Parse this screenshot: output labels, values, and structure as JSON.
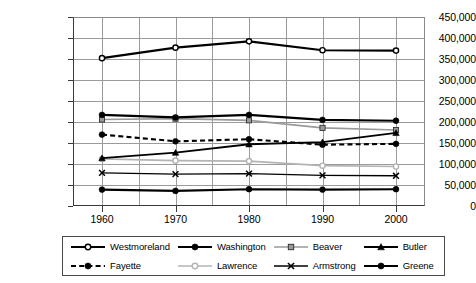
{
  "chart_data": {
    "type": "line",
    "title": "",
    "xlabel": "",
    "ylabel": "",
    "categories": [
      "1960",
      "1970",
      "1980",
      "1990",
      "2000"
    ],
    "x": [
      1960,
      1970,
      1980,
      1990,
      2000
    ],
    "ylim": [
      0,
      450000
    ],
    "ytick_step": 50000,
    "ytick_labels": [
      "450,000",
      "400,000",
      "350,000",
      "300,000",
      "250,000",
      "200,000",
      "150,000",
      "100,000",
      "50,000",
      "0"
    ],
    "ytick_values": [
      450000,
      400000,
      350000,
      300000,
      250000,
      200000,
      150000,
      100000,
      50000,
      0
    ],
    "grid": true,
    "legend_position": "bottom",
    "series": [
      {
        "name": "Westmoreland",
        "values": [
          352000,
          377000,
          392000,
          371000,
          370000
        ],
        "color": "#000000",
        "marker": "circle-open",
        "dash": "solid",
        "width": 2.1
      },
      {
        "name": "Washington",
        "values": [
          217000,
          211000,
          217000,
          205000,
          203000
        ],
        "color": "#000000",
        "marker": "circle-filled",
        "dash": "solid",
        "width": 2.1
      },
      {
        "name": "Beaver",
        "values": [
          206000,
          208000,
          204000,
          186000,
          181000
        ],
        "color": "#9a9a9a",
        "marker": "square-filled",
        "dash": "solid",
        "width": 1.7
      },
      {
        "name": "Butler",
        "values": [
          114000,
          127000,
          147000,
          152000,
          174000
        ],
        "color": "#000000",
        "marker": "triangle-filled",
        "dash": "solid",
        "width": 1.9
      },
      {
        "name": "Fayette",
        "values": [
          170000,
          154000,
          159000,
          146000,
          148000
        ],
        "color": "#000000",
        "marker": "circle-filled",
        "dash": "dashed",
        "width": 2.1
      },
      {
        "name": "Lawrence",
        "values": [
          112000,
          108000,
          107000,
          96000,
          94000
        ],
        "color": "#b4b4b4",
        "marker": "circle-open",
        "dash": "solid",
        "width": 1.7
      },
      {
        "name": "Armstrong",
        "values": [
          79000,
          76000,
          77000,
          73000,
          72000
        ],
        "color": "#000000",
        "marker": "x",
        "dash": "solid",
        "width": 1.3
      },
      {
        "name": "Greene",
        "values": [
          39000,
          36000,
          40000,
          39000,
          40000
        ],
        "color": "#000000",
        "marker": "circle-filled",
        "dash": "solid",
        "width": 2.1
      }
    ]
  },
  "legend": {
    "entries": [
      {
        "label": "Westmoreland"
      },
      {
        "label": "Washington"
      },
      {
        "label": "Beaver"
      },
      {
        "label": "Butler"
      },
      {
        "label": "Fayette"
      },
      {
        "label": "Lawrence"
      },
      {
        "label": "Armstrong"
      },
      {
        "label": "Greene"
      }
    ]
  }
}
